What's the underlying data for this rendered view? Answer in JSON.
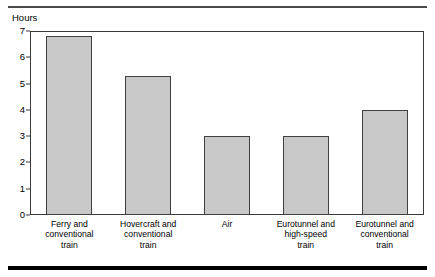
{
  "chart_data": {
    "type": "bar",
    "title": "",
    "subtitle": "",
    "xlabel": "",
    "ylabel": "Hours",
    "ylim": [
      0,
      7
    ],
    "yticks": [
      0,
      1,
      2,
      3,
      4,
      5,
      6,
      7
    ],
    "ytick_labels": [
      "0",
      "1",
      "2",
      "3",
      "4",
      "5",
      "6",
      "7"
    ],
    "grid": false,
    "legend": null,
    "categories": [
      "Ferry and\nconventional\ntrain",
      "Hovercraft and\nconventional\ntrain",
      "Air",
      "Eurotunnel and\nhigh-speed\ntrain",
      "Eurotunnel and\nconventional\ntrain"
    ],
    "values": [
      6.8,
      5.3,
      3.0,
      3.0,
      4.0
    ],
    "bar_color": "#c8c8c8",
    "bar_edge_color": "#404040",
    "frame_color": "#3a3a3a"
  },
  "rules": {
    "top": "",
    "bottom": ""
  }
}
